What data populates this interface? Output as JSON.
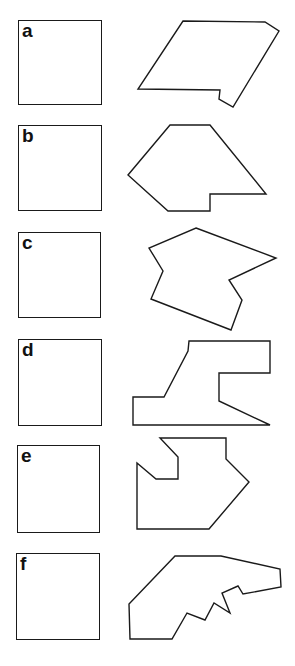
{
  "figure": {
    "panels": [
      {
        "label": "a",
        "square": {
          "x": 18,
          "y": 20,
          "w": 84,
          "h": 85
        },
        "polygon": "183,21 265,22 279,31 233,107 219,99 220,90 138,89"
      },
      {
        "label": "b",
        "square": {
          "x": 18,
          "y": 125,
          "w": 84,
          "h": 86
        },
        "polygon": "170,125 210,125 266,194 210,194 210,211 168,211 128,175"
      },
      {
        "label": "c",
        "square": {
          "x": 18,
          "y": 232,
          "w": 83,
          "h": 86
        },
        "polygon": "196,228 276,258 229,280 242,300 231,330 151,299 163,271 149,248"
      },
      {
        "label": "d",
        "square": {
          "x": 18,
          "y": 339,
          "w": 84,
          "h": 87
        },
        "polygon": "189,341 270,341 270,373 219,373 219,401 270,425 133,425 133,397 164,397 188,351"
      },
      {
        "label": "e",
        "square": {
          "x": 17,
          "y": 445,
          "w": 83,
          "h": 88
        },
        "polygon": "160,438 226,438 226,459 249,482 209,529 137,529 137,463 156,479 178,479 178,457"
      },
      {
        "label": "f",
        "square": {
          "x": 16,
          "y": 553,
          "w": 84,
          "h": 87
        },
        "polygon": "175,556 221,556 280,569 281,587 243,594 238,586 222,593 230,613 214,603 205,620 187,613 172,639 130,639 129,604"
      }
    ]
  }
}
